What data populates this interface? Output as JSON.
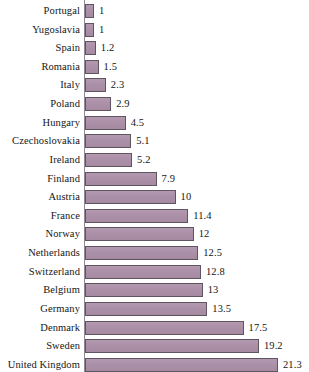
{
  "chart_data": {
    "type": "bar",
    "orientation": "horizontal",
    "title": "",
    "subtitle": "",
    "xlabel": "",
    "ylabel": "",
    "grid": false,
    "legend": null,
    "xlim": [
      0,
      21.3
    ],
    "categories": [
      "Portugal",
      "Yugoslavia",
      "Spain",
      "Romania",
      "Italy",
      "Poland",
      "Hungary",
      "Czechoslovakia",
      "Ireland",
      "Finland",
      "Austria",
      "France",
      "Norway",
      "Netherlands",
      "Switzerland",
      "Belgium",
      "Germany",
      "Denmark",
      "Sweden",
      "United Kingdom"
    ],
    "values": [
      1,
      1,
      1.2,
      1.5,
      2.3,
      2.9,
      4.5,
      5.1,
      5.2,
      7.9,
      10,
      11.4,
      12,
      12.5,
      12.8,
      13,
      13.5,
      17.5,
      19.2,
      21.3
    ],
    "value_labels": [
      "1",
      "1",
      "1.2",
      "1.5",
      "2.3",
      "2.9",
      "4.5",
      "5.1",
      "5.2",
      "7.9",
      "10",
      "11.4",
      "12",
      "12.5",
      "12.8",
      "13",
      "13.5",
      "17.5",
      "19.2",
      "21.3"
    ],
    "colors": {
      "bar_fill": "#ab8fa8",
      "bar_border": "#5f5560",
      "axis_line": "#8f8a92",
      "text": "#161616",
      "background": "#ffffff"
    }
  }
}
